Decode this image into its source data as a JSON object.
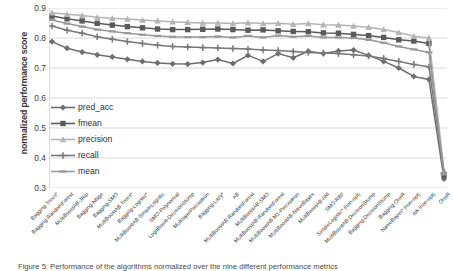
{
  "chart_data": {
    "type": "line",
    "title": "",
    "xlabel": "",
    "ylabel": "normalized performance score",
    "ylim": [
      0.3,
      0.9
    ],
    "yticks": [
      "0.3",
      "0.4",
      "0.5",
      "0.6",
      "0.7",
      "0.8",
      "0.9"
    ],
    "grid": true,
    "legend_position": "inside-left",
    "categories": [
      "Bagging-Trees*",
      "Bagging-RandomForest",
      "MultiBoostAB-JRip",
      "Bagging-NNge",
      "Bagging-SMO",
      "MultiBoostAB-Trees*",
      "Bagging-Logistic*",
      "MultiBoostAB-SimpleLogistic",
      "SMO-Polynomial",
      "LogitBoost-DecisionStump",
      "MultilayerPerceptron",
      "Bagging-Lazy*",
      "AB",
      "MultiBoostAB-RandomForest",
      "MultiBoostAB-SMO",
      "MultiBoostAB-RandomForest",
      "MultiBoostAB-M1-Perceptron",
      "MultiBoostAB-NaiveBayes",
      "MultiBoostAB-IWI",
      "SMO-RBF",
      "SimpleLogistic* (non-opt)",
      "MultiBoostAB-DecisionStump",
      "Bagging-DecisionStump",
      "Bagging-OneR",
      "NaiveBayes* (non-opt)",
      "Ibk (non-opt)",
      "OneR"
    ],
    "series": [
      {
        "name": "pred_acc",
        "color": "#6e6e6e",
        "marker": "diamond",
        "values": [
          0.788,
          0.766,
          0.753,
          0.744,
          0.737,
          0.729,
          0.722,
          0.717,
          0.714,
          0.713,
          0.718,
          0.728,
          0.715,
          0.742,
          0.722,
          0.748,
          0.734,
          0.756,
          0.748,
          0.757,
          0.76,
          0.742,
          0.722,
          0.7,
          0.672,
          0.662,
          0.33
        ]
      },
      {
        "name": "fmean",
        "color": "#5a5a5a",
        "marker": "square",
        "values": [
          0.873,
          0.864,
          0.857,
          0.849,
          0.843,
          0.838,
          0.834,
          0.83,
          0.828,
          0.828,
          0.829,
          0.83,
          0.828,
          0.826,
          0.827,
          0.824,
          0.822,
          0.821,
          0.817,
          0.816,
          0.812,
          0.808,
          0.802,
          0.794,
          0.79,
          0.782,
          0.342
        ]
      },
      {
        "name": "precision",
        "color": "#b4b4b4",
        "marker": "triangle",
        "values": [
          0.884,
          0.879,
          0.875,
          0.869,
          0.866,
          0.863,
          0.86,
          0.857,
          0.854,
          0.852,
          0.85,
          0.85,
          0.848,
          0.851,
          0.848,
          0.849,
          0.846,
          0.848,
          0.844,
          0.843,
          0.84,
          0.836,
          0.828,
          0.818,
          0.806,
          0.8,
          0.358
        ]
      },
      {
        "name": "recall",
        "color": "#787878",
        "marker": "cross",
        "values": [
          0.84,
          0.826,
          0.816,
          0.804,
          0.796,
          0.788,
          0.782,
          0.776,
          0.772,
          0.77,
          0.768,
          0.767,
          0.765,
          0.763,
          0.76,
          0.758,
          0.755,
          0.752,
          0.75,
          0.748,
          0.744,
          0.74,
          0.732,
          0.722,
          0.712,
          0.704,
          0.35
        ]
      },
      {
        "name": "mean",
        "color": "#999999",
        "marker": "line",
        "values": [
          0.86,
          0.848,
          0.838,
          0.828,
          0.822,
          0.816,
          0.811,
          0.807,
          0.804,
          0.803,
          0.803,
          0.805,
          0.802,
          0.807,
          0.802,
          0.808,
          0.804,
          0.807,
          0.802,
          0.802,
          0.8,
          0.794,
          0.784,
          0.772,
          0.762,
          0.752,
          0.346
        ]
      }
    ],
    "legend": [
      {
        "label": "pred_acc",
        "color": "#6e6e6e",
        "marker": "diamond"
      },
      {
        "label": "fmean",
        "color": "#5a5a5a",
        "marker": "square"
      },
      {
        "label": "precision",
        "color": "#b4b4b4",
        "marker": "triangle"
      },
      {
        "label": "recall",
        "color": "#787878",
        "marker": "cross"
      },
      {
        "label": "mean",
        "color": "#999999",
        "marker": "line"
      }
    ]
  },
  "caption": "Figure 5: Performance of the algorithms normalized over the nine different performance metrics"
}
